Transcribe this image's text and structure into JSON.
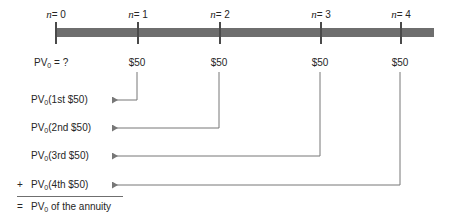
{
  "figure": {
    "kind": "present-value-annuity-timeline",
    "stroke_color": "#777777",
    "bar_color": "#6e6e6e",
    "tick_color": "#4a4a4a",
    "text_color": "#262626",
    "background": "#ffffff"
  },
  "timeline": {
    "periods": [
      {
        "n_prefix": "n",
        "n_text": "= 0",
        "label": "n= 0",
        "x": 55
      },
      {
        "n_prefix": "n",
        "n_text": "= 1",
        "label": "n= 1",
        "x": 137
      },
      {
        "n_prefix": "n",
        "n_text": "= 2",
        "label": "n= 2",
        "x": 219
      },
      {
        "n_prefix": "n",
        "n_text": "= 3",
        "label": "n= 3",
        "x": 320
      },
      {
        "n_prefix": "n",
        "n_text": "= 4",
        "label": "n= 4",
        "x": 400
      }
    ],
    "bar": {
      "x": 55,
      "y": 28,
      "width": 379,
      "height": 9
    },
    "tick": {
      "y": 22,
      "height": 22
    }
  },
  "cashflows": [
    {
      "label": "PV",
      "sub": "0",
      "suffix": " = ?",
      "is_query": true,
      "x": 34,
      "y": 57
    },
    {
      "label": "$50",
      "x": 137,
      "y": 57
    },
    {
      "label": "$50",
      "x": 219,
      "y": 57
    },
    {
      "label": "$50",
      "x": 320,
      "y": 57
    },
    {
      "label": "$50",
      "x": 400,
      "y": 57
    }
  ],
  "pv_rows": [
    {
      "sign": "",
      "prefix": "PV",
      "sub": "0",
      "text": "(1st $50)",
      "label_x": 31,
      "y": 100,
      "source_x": 137,
      "arrow_x": 106
    },
    {
      "sign": "",
      "prefix": "PV",
      "sub": "0",
      "text": "(2nd $50)",
      "label_x": 31,
      "y": 128,
      "source_x": 219,
      "arrow_x": 106
    },
    {
      "sign": "",
      "prefix": "PV",
      "sub": "0",
      "text": "(3rd $50)",
      "label_x": 31,
      "y": 156,
      "source_x": 320,
      "arrow_x": 106
    },
    {
      "sign": "+",
      "prefix": "PV",
      "sub": "0",
      "text": "(4th $50)",
      "label_x": 31,
      "y": 185,
      "source_x": 400,
      "arrow_x": 106
    }
  ],
  "plus_sign": {
    "text": "+",
    "x": 17,
    "y": 185
  },
  "equals_sign": {
    "text": "=",
    "x": 17,
    "y": 207
  },
  "total_row": {
    "prefix": "PV",
    "sub": "0",
    "text": " of the annuity",
    "x": 31,
    "y": 207
  },
  "sum_rule": {
    "x": 17,
    "y": 196,
    "width": 106
  }
}
